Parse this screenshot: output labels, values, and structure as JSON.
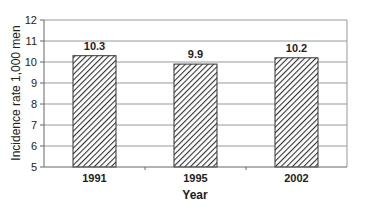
{
  "chart_data": {
    "type": "bar",
    "title": "",
    "categories": [
      "1991",
      "1995",
      "2002"
    ],
    "values": [
      10.3,
      9.9,
      10.2
    ],
    "value_labels": [
      "10.3",
      "9.9",
      "10.2"
    ],
    "xlabel": "Year",
    "ylabel": "Incidence rate 1,000 men",
    "ylim": [
      5,
      12
    ],
    "yticks": [
      5,
      6,
      7,
      8,
      9,
      10,
      11,
      12
    ],
    "grid": true,
    "legend": null,
    "bar_fill": "diagonal-hatch",
    "colors": {
      "bar_stroke": "#333333",
      "hatch": "#333333",
      "grid": "#999999",
      "axis": "#666666"
    }
  }
}
